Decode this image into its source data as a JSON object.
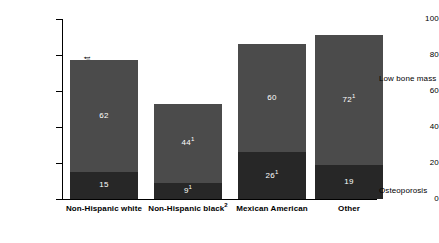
{
  "chart_data": {
    "type": "bar",
    "subtype": "stacked-vertical",
    "title": "",
    "xlabel": "",
    "ylabel": "Age-adjusted percent",
    "ylim": [
      0,
      100
    ],
    "yticks": [
      0,
      20,
      40,
      60,
      80,
      100
    ],
    "ytick_labels": [
      "0",
      "20",
      "40",
      "60",
      "80",
      "100"
    ],
    "grid": false,
    "legend_position": "right-inline",
    "categories": [
      "Non-Hispanic white",
      "Non-Hispanic black",
      "Mexican American",
      "Other"
    ],
    "category_labels": [
      {
        "text": "Non-Hispanic white",
        "footnote": ""
      },
      {
        "text": "Non-Hispanic black",
        "footnote": "2"
      },
      {
        "text": "Mexican American",
        "footnote": ""
      },
      {
        "text": "Other",
        "footnote": ""
      }
    ],
    "series": [
      {
        "name": "Osteoporosis",
        "color": "#272727",
        "values": [
          15,
          9,
          26,
          19
        ],
        "value_labels": [
          {
            "text": "15",
            "footnote": ""
          },
          {
            "text": "9",
            "footnote": "1"
          },
          {
            "text": "26",
            "footnote": "1"
          },
          {
            "text": "19",
            "footnote": ""
          }
        ]
      },
      {
        "name": "Low bone mass",
        "color": "#4b4b4b",
        "values": [
          62,
          44,
          60,
          72
        ],
        "value_labels": [
          {
            "text": "62",
            "footnote": ""
          },
          {
            "text": "44",
            "footnote": "1"
          },
          {
            "text": "60",
            "footnote": ""
          },
          {
            "text": "72",
            "footnote": "1"
          }
        ]
      }
    ],
    "totals": [
      77,
      53,
      86,
      91
    ],
    "annotations": [
      {
        "name": "low-bone-mass",
        "text": "Low bone mass"
      },
      {
        "name": "osteoporosis",
        "text": "Osteoporosis"
      }
    ]
  }
}
